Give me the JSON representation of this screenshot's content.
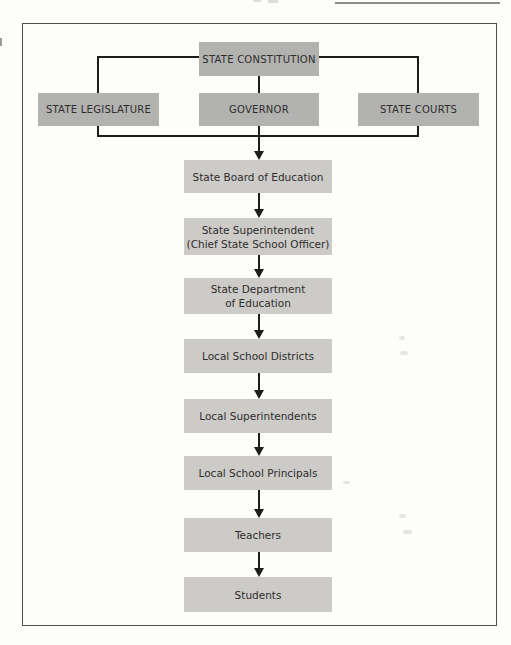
{
  "figure": {
    "type": "flowchart",
    "nodes": {
      "constitution": "STATE CONSTITUTION",
      "legislature": "STATE LEGISLATURE",
      "governor": "GOVERNOR",
      "courts": "STATE COURTS"
    },
    "chain": [
      {
        "label": "State Board of Education"
      },
      {
        "label": "State Superintendent\n(Chief State School Officer)"
      },
      {
        "label": "State Department\nof Education"
      },
      {
        "label": "Local School Districts"
      },
      {
        "label": "Local Superintendents"
      },
      {
        "label": "Local School Principals"
      },
      {
        "label": "Teachers"
      },
      {
        "label": "Students"
      }
    ],
    "colors": {
      "top_box_fill": "#b2b2b0",
      "chain_box_fill": "#cccbc8",
      "text": "#2f2e2c",
      "line": "#1d1d1b",
      "frame_border": "#4f4f4d"
    }
  }
}
